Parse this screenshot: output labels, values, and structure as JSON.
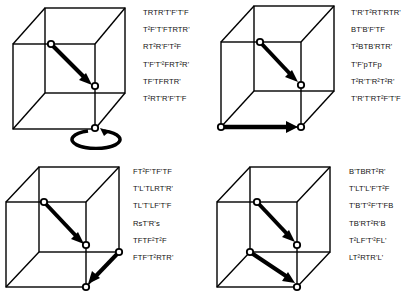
{
  "panels": [
    {
      "id": "top-left",
      "diagram": "cube with diagonal arrow from upper-front-left interior to center node, and rotation arrow at bottom node",
      "sequences": [
        "TRTR'T'F'T'F",
        "T²F'T'FTRTR'",
        "RT²R'F'T²F",
        "T'F'T'²FRT²R'",
        "TF'TFRTR'",
        "T²RT'R'F'T'F"
      ]
    },
    {
      "id": "top-right",
      "diagram": "cube with diagonal arrow to center node and horizontal arrow along bottom front edge",
      "sequences": [
        "T'R'T²RT'RTR'",
        "BT'B'F'TF",
        "T²BTB'RTR'",
        "T'F'pTFp",
        "T²R'T'R²T²R'",
        "T'R'T'RT²F'T'F"
      ]
    },
    {
      "id": "bottom-left",
      "diagram": "cube with diagonal arrow to center node and diagonal arrow from right edge to bottom front corner",
      "sequences": [
        "FT²F'TF'TF",
        "T'L'TLRT'R'",
        "TL'T'LF'T'F",
        "RsT'R's",
        "TFTF²T²F",
        "FTF'T²RTR'"
      ]
    },
    {
      "id": "bottom-right",
      "diagram": "cube with two parallel diagonal arrows to center node and bottom front corner",
      "sequences": [
        "B'TBRT²R'",
        "T'LT'L'F'T²F",
        "T'B'T'²F'T'FB",
        "TB'RT²R'B",
        "T²LF'T'²FL'",
        "LT²RTR'L'"
      ]
    }
  ]
}
